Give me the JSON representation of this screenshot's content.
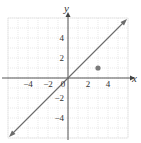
{
  "chart_data": {
    "type": "line",
    "title": "",
    "xlabel": "x",
    "ylabel": "y",
    "xlim": [
      -6,
      6
    ],
    "ylim": [
      -6,
      6
    ],
    "grid": true,
    "x_ticks": [
      -4,
      -2,
      0,
      2,
      4
    ],
    "y_ticks": [
      4,
      2,
      -2,
      -4
    ],
    "x_tick_labels": [
      "−4",
      "−2",
      "0",
      "2",
      "4"
    ],
    "y_tick_labels": [
      "4",
      "2",
      "−2",
      "−4"
    ],
    "series": [
      {
        "name": "y = x",
        "kind": "line",
        "x": [
          -6,
          6
        ],
        "y": [
          -6,
          6
        ],
        "arrows": "both",
        "color": "#666666"
      },
      {
        "name": "point",
        "kind": "scatter",
        "x": [
          3
        ],
        "y": [
          1
        ],
        "color": "#777777"
      }
    ]
  },
  "labels": {
    "x_axis": "x",
    "y_axis": "y",
    "origin": "0",
    "xt_m4": "−4",
    "xt_m2": "−2",
    "xt_2": "2",
    "xt_4": "4",
    "yt_4": "4",
    "yt_2": "2",
    "yt_m2": "−2",
    "yt_m4": "−4"
  }
}
